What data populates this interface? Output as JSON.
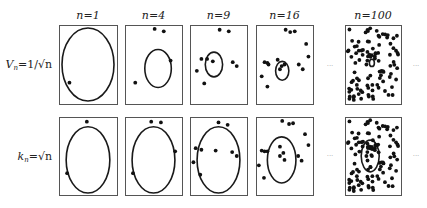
{
  "figure": {
    "columns": [
      {
        "label": "n=1",
        "n": 1
      },
      {
        "label": "n=4",
        "n": 4
      },
      {
        "label": "n=9",
        "n": 9
      },
      {
        "label": "n=16",
        "n": 16
      },
      {
        "label": "n=100",
        "n": 100
      }
    ],
    "rows": [
      {
        "label": "V_n = 1/√n",
        "label_main": "V",
        "label_sub": "n",
        "label_rest": "=1/√n",
        "ellipse_rx": [
          1.0,
          0.52,
          0.34,
          0.26,
          0.1
        ],
        "ellipse_ry": [
          1.0,
          0.52,
          0.34,
          0.26,
          0.1
        ]
      },
      {
        "label": "k_n = √n",
        "label_main": "k",
        "label_sub": "n",
        "label_rest": "=√n",
        "ellipse_rx": [
          0.84,
          0.84,
          0.84,
          0.56,
          0.36
        ],
        "ellipse_ry": [
          0.92,
          0.92,
          0.92,
          0.64,
          0.44
        ]
      }
    ],
    "ellipsis": "···",
    "row1_ellipse_center": [
      [
        0.5,
        0.5
      ],
      [
        0.58,
        0.55
      ],
      [
        0.42,
        0.5
      ],
      [
        0.46,
        0.58
      ],
      [
        0.48,
        0.48
      ]
    ],
    "row2_ellipse_center": [
      [
        0.5,
        0.55
      ],
      [
        0.5,
        0.55
      ],
      [
        0.5,
        0.55
      ],
      [
        0.45,
        0.55
      ],
      [
        0.45,
        0.5
      ]
    ],
    "dots": {
      "row1": [
        [
          [
            0.18,
            0.73
          ]
        ],
        [
          [
            0.52,
            0.05
          ],
          [
            0.68,
            0.08
          ],
          [
            0.8,
            0.45
          ],
          [
            0.18,
            0.73
          ]
        ],
        [
          [
            0.52,
            0.06
          ],
          [
            0.68,
            0.08
          ],
          [
            0.2,
            0.43
          ],
          [
            0.3,
            0.43
          ],
          [
            0.4,
            0.46
          ],
          [
            0.75,
            0.47
          ],
          [
            0.82,
            0.52
          ],
          [
            0.12,
            0.58
          ],
          [
            0.25,
            0.74
          ]
        ],
        [
          [
            0.52,
            0.06
          ],
          [
            0.6,
            0.09
          ],
          [
            0.68,
            0.08
          ],
          [
            0.88,
            0.24
          ],
          [
            0.92,
            0.4
          ],
          [
            0.15,
            0.47
          ],
          [
            0.2,
            0.48
          ],
          [
            0.22,
            0.5
          ],
          [
            0.38,
            0.44
          ],
          [
            0.45,
            0.52
          ],
          [
            0.42,
            0.56
          ],
          [
            0.75,
            0.5
          ],
          [
            0.82,
            0.56
          ],
          [
            0.1,
            0.65
          ],
          [
            0.2,
            0.78
          ],
          [
            0.5,
            0.5
          ]
        ]
      ],
      "row2": [
        [
          [
            0.48,
            0.06
          ],
          [
            0.14,
            0.72
          ]
        ],
        [
          [
            0.46,
            0.06
          ],
          [
            0.63,
            0.07
          ],
          [
            0.88,
            0.44
          ],
          [
            0.14,
            0.72
          ]
        ],
        [
          [
            0.5,
            0.07
          ],
          [
            0.66,
            0.1
          ],
          [
            0.1,
            0.4
          ],
          [
            0.2,
            0.42
          ],
          [
            0.45,
            0.43
          ],
          [
            0.74,
            0.45
          ],
          [
            0.82,
            0.5
          ],
          [
            0.06,
            0.58
          ],
          [
            0.18,
            0.74
          ]
        ],
        [
          [
            0.46,
            0.05
          ],
          [
            0.58,
            0.09
          ],
          [
            0.65,
            0.08
          ],
          [
            0.86,
            0.22
          ],
          [
            0.92,
            0.36
          ],
          [
            0.1,
            0.43
          ],
          [
            0.15,
            0.44
          ],
          [
            0.2,
            0.44
          ],
          [
            0.42,
            0.38
          ],
          [
            0.48,
            0.46
          ],
          [
            0.42,
            0.5
          ],
          [
            0.74,
            0.5
          ],
          [
            0.8,
            0.56
          ],
          [
            0.05,
            0.62
          ],
          [
            0.14,
            0.78
          ],
          [
            0.5,
            0.55
          ]
        ]
      ]
    }
  }
}
